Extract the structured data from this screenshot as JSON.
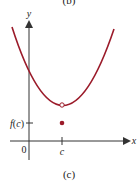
{
  "top_caption": "(b)",
  "caption": "(c)",
  "axes": {
    "y_label": "y",
    "x_label": "x",
    "origin_label": "0",
    "x_tick_label": "c",
    "y_tick_label": "f(c)"
  },
  "colors": {
    "curve": "#9b1b2a",
    "axis": "#333333",
    "point": "#9b1b2a"
  },
  "points": {
    "open_circle": "removable discontinuity at x = c (hole in curve)",
    "filled_dot": "value f(c) below the curve"
  }
}
